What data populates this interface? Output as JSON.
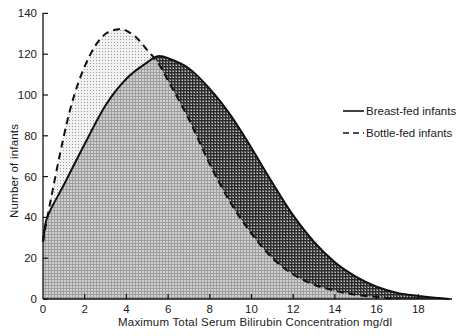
{
  "chart_data": {
    "type": "area",
    "title": "",
    "xlabel": "Maximum Total Serum Bilirubin Concentration mg/dl",
    "ylabel": "Number of infants",
    "xlim": [
      0,
      20
    ],
    "ylim": [
      0,
      140
    ],
    "xticks": [
      0,
      2,
      4,
      6,
      8,
      10,
      12,
      14,
      16,
      18
    ],
    "yticks": [
      0,
      20,
      40,
      60,
      80,
      100,
      120,
      140
    ],
    "grid": false,
    "legend_position": "right-middle",
    "series": [
      {
        "name": "Breast-fed infants",
        "line_style": "solid",
        "x": [
          0,
          0.2,
          1,
          2,
          3,
          4,
          5,
          5.5,
          6,
          7,
          8,
          9,
          10,
          11,
          12,
          13,
          14,
          15,
          16,
          17,
          18,
          19,
          19.5
        ],
        "values": [
          28,
          40,
          56,
          76,
          95,
          108,
          116,
          119,
          118,
          113,
          103,
          90,
          74,
          57,
          41,
          28,
          18,
          11,
          6,
          3,
          1.5,
          0.5,
          0
        ]
      },
      {
        "name": "Bottle-fed infants",
        "line_style": "dashed",
        "x": [
          0,
          0.3,
          1,
          1.5,
          2,
          2.5,
          3,
          3.5,
          3.9,
          4.5,
          5,
          5.5,
          6,
          7,
          8,
          9,
          10,
          11,
          12,
          13,
          14,
          15,
          16,
          17
        ],
        "values": [
          28,
          45,
          80,
          100,
          114,
          124,
          130,
          132,
          132,
          128,
          122,
          116,
          107,
          88,
          66,
          47,
          32,
          20,
          12,
          7,
          4,
          2,
          1,
          0
        ]
      }
    ]
  },
  "axes": {
    "x_title": "Maximum Total Serum Bilirubin Concentration mg/dl",
    "y_title": "Number of infants",
    "x_tick_labels": [
      "0",
      "2",
      "4",
      "6",
      "8",
      "10",
      "12",
      "14",
      "16",
      "18"
    ],
    "y_tick_labels": [
      "0",
      "20",
      "40",
      "60",
      "80",
      "100",
      "120",
      "140"
    ]
  },
  "legend": {
    "items": [
      {
        "label": "Breast-fed infants",
        "style": "solid"
      },
      {
        "label": "Bottle-fed infants",
        "style": "dashed"
      }
    ]
  },
  "colors": {
    "line": "#111111",
    "overlap_fill": "#b8b8b8",
    "bottle_only_fill": "#d9d9d9",
    "breast_only_fill": "#5a5a5a"
  }
}
